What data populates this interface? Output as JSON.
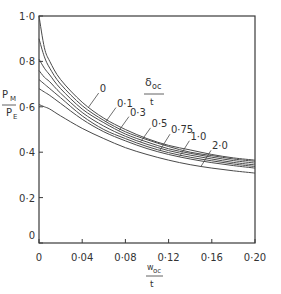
{
  "chart_data": {
    "type": "line",
    "title": "",
    "xlabel": "w_oc / t",
    "xlabel_parts": {
      "num": "w",
      "sub": "oc",
      "den": "t"
    },
    "ylabel": "P_M / P_E",
    "ylabel_parts": {
      "num": "P",
      "num_sub": "M",
      "den": "P",
      "den_sub": "E"
    },
    "legend_title": "δ_oc / t",
    "legend_title_parts": {
      "num": "δ",
      "sub": "oc",
      "den": "t"
    },
    "xlim": [
      0,
      0.2
    ],
    "ylim": [
      0,
      1.0
    ],
    "x_ticks": [
      0,
      0.04,
      0.08,
      0.12,
      0.16,
      0.2
    ],
    "x_tick_labels": [
      "0",
      "0·04",
      "0·08",
      "0·12",
      "0·16",
      "0·20"
    ],
    "y_ticks": [
      0,
      0.2,
      0.4,
      0.6,
      0.8,
      1.0
    ],
    "y_tick_labels": [
      "0",
      "0·2",
      "0·4",
      "0·6",
      "0·8",
      "1·0"
    ],
    "grid": false,
    "x": [
      0,
      0.005,
      0.01,
      0.02,
      0.04,
      0.06,
      0.08,
      0.1,
      0.12,
      0.14,
      0.16,
      0.18,
      0.2
    ],
    "series": [
      {
        "name": "0",
        "label": "0",
        "values": [
          1.0,
          0.86,
          0.8,
          0.72,
          0.62,
          0.55,
          0.5,
          0.46,
          0.43,
          0.41,
          0.39,
          0.375,
          0.365
        ]
      },
      {
        "name": "0.1",
        "label": "0·1",
        "values": [
          0.9,
          0.82,
          0.77,
          0.7,
          0.605,
          0.54,
          0.49,
          0.455,
          0.425,
          0.4,
          0.385,
          0.37,
          0.36
        ]
      },
      {
        "name": "0.3",
        "label": "0·3",
        "values": [
          0.81,
          0.77,
          0.74,
          0.68,
          0.59,
          0.53,
          0.48,
          0.445,
          0.415,
          0.395,
          0.378,
          0.363,
          0.352
        ]
      },
      {
        "name": "0.5",
        "label": "0·5",
        "values": [
          0.76,
          0.73,
          0.71,
          0.66,
          0.575,
          0.515,
          0.47,
          0.435,
          0.407,
          0.387,
          0.37,
          0.355,
          0.344
        ]
      },
      {
        "name": "0.75",
        "label": "0·75",
        "values": [
          0.72,
          0.7,
          0.68,
          0.64,
          0.56,
          0.5,
          0.46,
          0.425,
          0.398,
          0.378,
          0.362,
          0.348,
          0.337
        ]
      },
      {
        "name": "1.0",
        "label": "1·0",
        "values": [
          0.68,
          0.665,
          0.65,
          0.615,
          0.545,
          0.49,
          0.45,
          0.416,
          0.39,
          0.37,
          0.354,
          0.341,
          0.33
        ]
      },
      {
        "name": "2.0",
        "label": "2·0",
        "values": [
          0.61,
          0.6,
          0.59,
          0.56,
          0.505,
          0.46,
          0.42,
          0.39,
          0.365,
          0.345,
          0.33,
          0.318,
          0.308
        ]
      }
    ],
    "label_positions": [
      {
        "series": "0",
        "leader_x": 0.046,
        "text_dx": 10,
        "text_dy": -14
      },
      {
        "series": "0.1",
        "leader_x": 0.062,
        "text_dx": 10,
        "text_dy": -14
      },
      {
        "series": "0.3",
        "leader_x": 0.074,
        "text_dx": 10,
        "text_dy": -14
      },
      {
        "series": "0.5",
        "leader_x": 0.094,
        "text_dx": 10,
        "text_dy": -14
      },
      {
        "series": "0.75",
        "leader_x": 0.112,
        "text_dx": 10,
        "text_dy": -16
      },
      {
        "series": "1.0",
        "leader_x": 0.13,
        "text_dx": 10,
        "text_dy": -16
      },
      {
        "series": "2.0",
        "leader_x": 0.15,
        "text_dx": 10,
        "text_dy": -16
      }
    ],
    "colors": {
      "line": "#4a4a4a",
      "axis": "#3a3a3a",
      "text": "#333333",
      "background": "#ffffff"
    }
  }
}
